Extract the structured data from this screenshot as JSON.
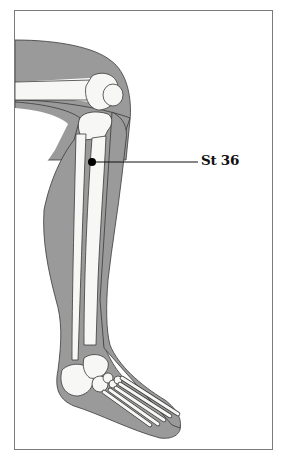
{
  "figure": {
    "colors": {
      "skin_silhouette": "#9a9a9a",
      "bone_fill": "#f7f7f5",
      "outline": "#3a3a3a",
      "frame_border": "#7a7a7a",
      "marker": "#000000"
    },
    "point": {
      "label": "St 36",
      "x": 92,
      "y": 162
    }
  }
}
